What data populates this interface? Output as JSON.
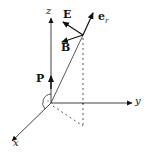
{
  "diagram": {
    "type": "3d-coordinate-vector-diagram",
    "axes": {
      "x": {
        "label": "x"
      },
      "y": {
        "label": "y"
      },
      "z": {
        "label": "z"
      }
    },
    "vectors": {
      "E": {
        "label": "E"
      },
      "B": {
        "label": "B"
      },
      "e_r": {
        "label": "e",
        "subscript": "r"
      },
      "P": {
        "label": "P"
      }
    },
    "colors": {
      "stroke": "#111111",
      "background": "#ffffff"
    }
  }
}
